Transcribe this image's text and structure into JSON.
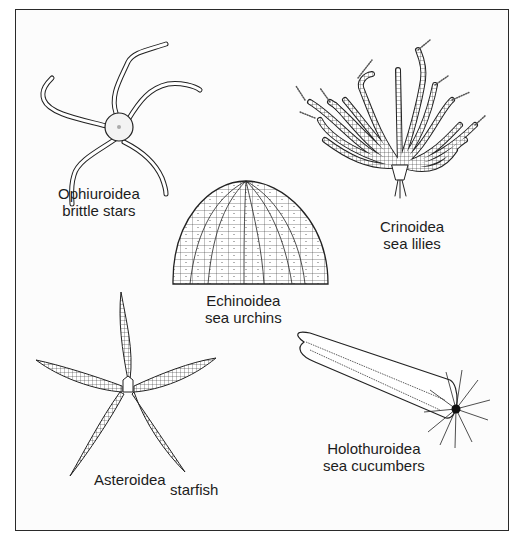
{
  "figure": {
    "colors": {
      "ink": "#1c1c1c",
      "frame": "#2a2a2a",
      "background": "#ffffff"
    },
    "groups": [
      {
        "id": "ophiuroidea",
        "class_name": "Ophiuroidea",
        "common_name": "brittle stars"
      },
      {
        "id": "crinoidea",
        "class_name": "Crinoidea",
        "common_name": "sea lilies"
      },
      {
        "id": "echinoidea",
        "class_name": "Echinoidea",
        "common_name": "sea urchins"
      },
      {
        "id": "asteroidea",
        "class_name": "Asteroidea",
        "common_name": "starfish"
      },
      {
        "id": "holothuroidea",
        "class_name": "Holothuroidea",
        "common_name": "sea cucumbers"
      }
    ]
  }
}
